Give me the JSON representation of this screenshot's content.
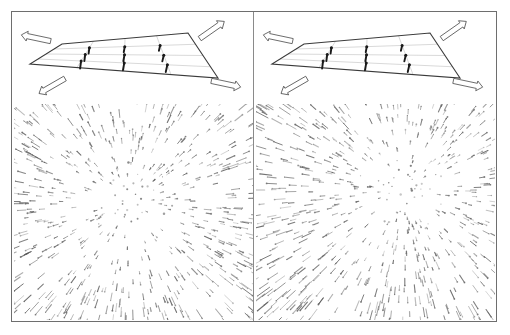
{
  "figure": {
    "background_color": "#ffffff",
    "frame_color": "#6e6e6e",
    "panel_count": 2
  },
  "panels": [
    {
      "id": "left",
      "name": "panel-left",
      "label": "",
      "diagram": {
        "name": "perspective-grid-diagram",
        "type": "ground-plane-grid",
        "rows": 4,
        "cols": 4,
        "outline_color": "#3a3a3a",
        "grid_line_color": "#b9b9b9",
        "vector_color": "#1a1a1a",
        "corner_arrows": [
          {
            "name": "arrow-top-left",
            "direction": "left",
            "angle_deg": 195
          },
          {
            "name": "arrow-top-right",
            "direction": "up-right",
            "angle_deg": 325
          },
          {
            "name": "arrow-bottom-left",
            "direction": "down-left",
            "angle_deg": 155
          },
          {
            "name": "arrow-bottom-right",
            "direction": "right",
            "angle_deg": 15
          }
        ],
        "cell_vectors": 9
      },
      "dot_field": {
        "name": "random-dot-flow-field",
        "pattern": "radial-expansion",
        "focus_of_expansion": {
          "x_pct": 48,
          "y_pct": 46
        },
        "dot_count": 620,
        "dot_color": "#6b6b6b",
        "streak_color": "#555555",
        "background_color": "#ffffff"
      }
    },
    {
      "id": "right",
      "name": "panel-right",
      "label": "",
      "diagram": {
        "name": "perspective-grid-diagram",
        "type": "ground-plane-grid",
        "rows": 4,
        "cols": 4,
        "outline_color": "#3a3a3a",
        "grid_line_color": "#b9b9b9",
        "vector_color": "#1a1a1a",
        "corner_arrows": [
          {
            "name": "arrow-top-left",
            "direction": "left",
            "angle_deg": 195
          },
          {
            "name": "arrow-top-right",
            "direction": "up-right",
            "angle_deg": 325
          },
          {
            "name": "arrow-bottom-left",
            "direction": "down-left",
            "angle_deg": 155
          },
          {
            "name": "arrow-bottom-right",
            "direction": "right",
            "angle_deg": 15
          }
        ],
        "cell_vectors": 9
      },
      "dot_field": {
        "name": "random-dot-flow-field",
        "pattern": "radial-expansion-offset",
        "focus_of_expansion": {
          "x_pct": 62,
          "y_pct": 40
        },
        "dot_count": 640,
        "dot_color": "#6b6b6b",
        "streak_color": "#555555",
        "background_color": "#ffffff"
      }
    }
  ],
  "chart_data": {
    "type": "scatter",
    "title": "",
    "xlabel": "",
    "ylabel": "",
    "series": [
      {
        "name": "left-panel-flow-field",
        "pattern": "radial expansion about focus of expansion",
        "focus": [
          0.48,
          0.46
        ],
        "n_points": 620
      },
      {
        "name": "right-panel-flow-field",
        "pattern": "radial expansion about offset focus",
        "focus": [
          0.62,
          0.4
        ],
        "n_points": 640
      }
    ],
    "grid": false,
    "legend": "none"
  }
}
